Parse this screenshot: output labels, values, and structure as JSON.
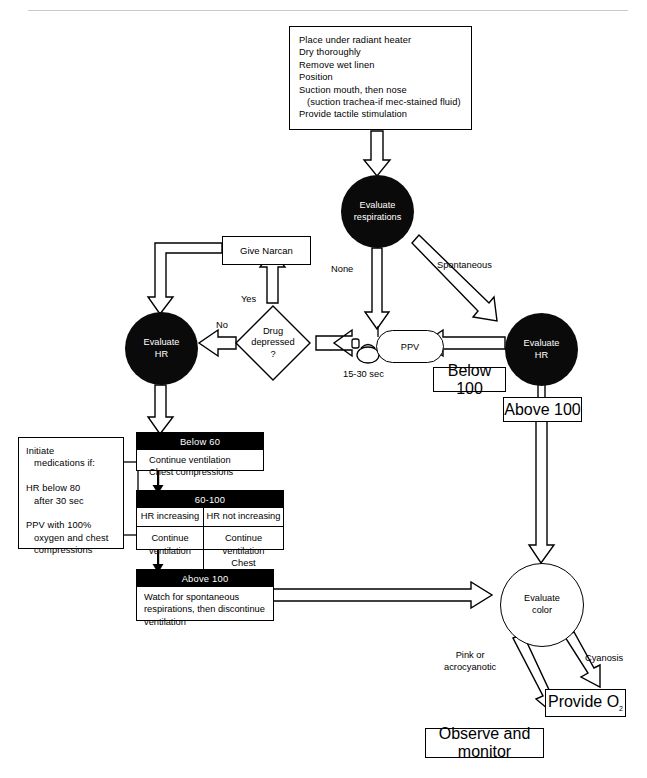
{
  "diagram": {
    "initial_steps": {
      "lines": [
        "Place under radiant heater",
        "Dry thoroughly",
        "Remove wet linen",
        "Position",
        "Suction mouth, then nose",
        "   (suction trachea-if mec-stained fluid)",
        "Provide tactile stimulation"
      ],
      "text": "Place under radiant heater\nDry thoroughly\nRemove wet linen\nPosition\nSuction mouth, then nose\n   (suction trachea-if mec-stained fluid)\nProvide tactile stimulation"
    },
    "nodes": {
      "evaluate_respirations": "Evaluate\nrespirations",
      "evaluate_hr_left": "Evaluate\nHR",
      "evaluate_hr_right": "Evaluate\nHR",
      "evaluate_color": "Evaluate\ncolor",
      "give_narcan": "Give Narcan",
      "drug_depressed": "Drug\ndepressed\n?",
      "ppv": "PPV",
      "below_100": "Below 100",
      "above_100_right": "Above 100",
      "provide_o2": "Provide O",
      "provide_o2_sub": "2",
      "observe_monitor": "Observe and monitor"
    },
    "edge_labels": {
      "none": "None",
      "spontaneous": "Spontaneous",
      "yes": "Yes",
      "no": "No",
      "duration": "15-30 sec",
      "pink_or_acrocyanotic": "Pink or\nacrocyanotic",
      "cyanosis": "Cyanosis"
    },
    "medication_box": {
      "text": "Initiate\n   medications if:\n\nHR below 80\n   after 30 sec\n\nPPV with 100%\n   oxygen and chest\n   compressions"
    },
    "tables": {
      "below_60": {
        "header": "Below 60",
        "body": "Continue ventilation\nChest compressions"
      },
      "mid_60_100": {
        "header": "60-100",
        "col1_header": "HR increasing",
        "col2_header": "HR not increasing",
        "col1_body": "Continue\nventilation",
        "col2_body_line1": "Continue ventilation",
        "col2_body_line2": "Chest compressions",
        "col2_body_line3_italic": "if",
        "col2_body_line3_rest": " HR below 80"
      },
      "above_100": {
        "header": "Above 100",
        "body": "Watch for spontaneous\n   respirations, then discontinue\n   ventilation"
      }
    },
    "colors": {
      "node_fill_dark": "#0a0a0a",
      "node_text_light": "#ffffff",
      "stroke": "#000000",
      "background": "#ffffff"
    }
  }
}
